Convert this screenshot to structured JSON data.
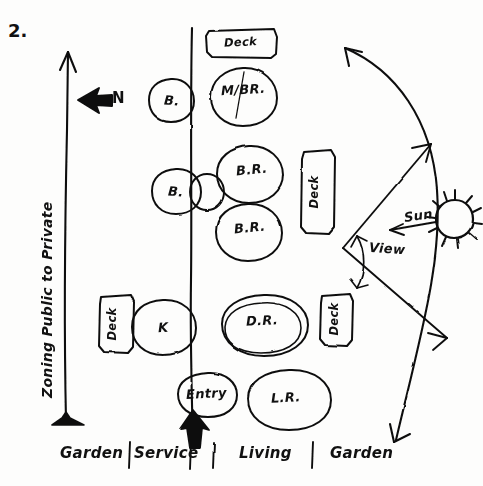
{
  "sheet": {
    "number": "2.",
    "title_vertical": "Zoning Public to Private",
    "north_label": "N"
  },
  "colors": {
    "ink": "#111111",
    "paper": "#fdfdfc"
  },
  "zones": {
    "divider_note": "vertical line splitting service side from living side",
    "footer": [
      {
        "label": "Garden"
      },
      {
        "label": "Service"
      },
      {
        "label": "Living"
      },
      {
        "label": "Garden"
      }
    ],
    "footer_separator": "|"
  },
  "bubbles": [
    {
      "id": "deck-top",
      "label": "Deck",
      "shape": "rect",
      "zone": "private"
    },
    {
      "id": "master-bed",
      "label": "M/BR.",
      "shape": "circle",
      "zone": "private"
    },
    {
      "id": "bath-top",
      "label": "B.",
      "shape": "circle",
      "zone": "service"
    },
    {
      "id": "bath-mid",
      "label": "B.",
      "shape": "circle",
      "zone": "service"
    },
    {
      "id": "closet-mid",
      "label": "",
      "shape": "circle",
      "zone": "divider"
    },
    {
      "id": "bedroom-1",
      "label": "B.R.",
      "shape": "circle",
      "zone": "private"
    },
    {
      "id": "bedroom-2",
      "label": "B.R.",
      "shape": "circle",
      "zone": "private"
    },
    {
      "id": "deck-right-upper",
      "label": "Deck",
      "shape": "rect",
      "zone": "private"
    },
    {
      "id": "deck-left",
      "label": "Deck",
      "shape": "rect",
      "zone": "service"
    },
    {
      "id": "kitchen",
      "label": "K",
      "shape": "circle",
      "zone": "service"
    },
    {
      "id": "dining",
      "label": "D.R.",
      "shape": "circle",
      "zone": "living"
    },
    {
      "id": "deck-right-lower",
      "label": "Deck",
      "shape": "rect",
      "zone": "living"
    },
    {
      "id": "entry",
      "label": "Entry",
      "shape": "circle",
      "zone": "divider"
    },
    {
      "id": "living",
      "label": "L.R.",
      "shape": "circle",
      "zone": "living"
    }
  ],
  "annotations": {
    "sun": "Sun",
    "view": "View"
  }
}
